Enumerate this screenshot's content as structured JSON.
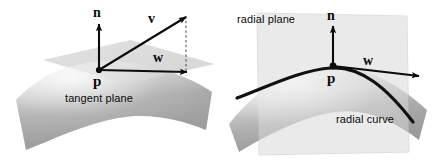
{
  "figure": {
    "background_color": "#ffffff",
    "width": 446,
    "height": 164
  },
  "colors": {
    "ink": "#0b0b0b",
    "plane_fill": "#d8d8d8",
    "plane_fill_light": "#e6e6e6",
    "surface_light": "#efefef",
    "surface_mid": "#bdbdbd",
    "surface_dark": "#8f8f8f",
    "curve": "#111111",
    "dashed": "#4a4a4a"
  },
  "panels": [
    {
      "id": "tangent-plane-panel",
      "caption": "tangent plane",
      "point_label": "p",
      "vectors": [
        {
          "name": "normal",
          "label": "n",
          "style": "solid"
        },
        {
          "name": "v-vector",
          "label": "v",
          "style": "solid"
        },
        {
          "name": "w-vector",
          "label": "w",
          "style": "solid"
        }
      ],
      "guides": [
        {
          "name": "v-to-w-projection",
          "style": "dashed"
        },
        {
          "name": "plane-edge-guide",
          "style": "dashed"
        }
      ],
      "surface": "curved saddle patch"
    },
    {
      "id": "radial-plane-panel",
      "caption_plane": "radial plane",
      "caption_curve": "radial curve",
      "point_label": "p",
      "vectors": [
        {
          "name": "normal",
          "label": "n",
          "style": "solid"
        },
        {
          "name": "w-vector",
          "label": "w",
          "style": "solid"
        }
      ],
      "surface": "curved saddle patch",
      "curve": "radial curve through p"
    }
  ],
  "labels": {
    "n": "n",
    "v": "v",
    "w": "w",
    "p": "p",
    "tangent_plane": "tangent plane",
    "radial_plane": "radial plane",
    "radial_curve": "radial curve"
  }
}
